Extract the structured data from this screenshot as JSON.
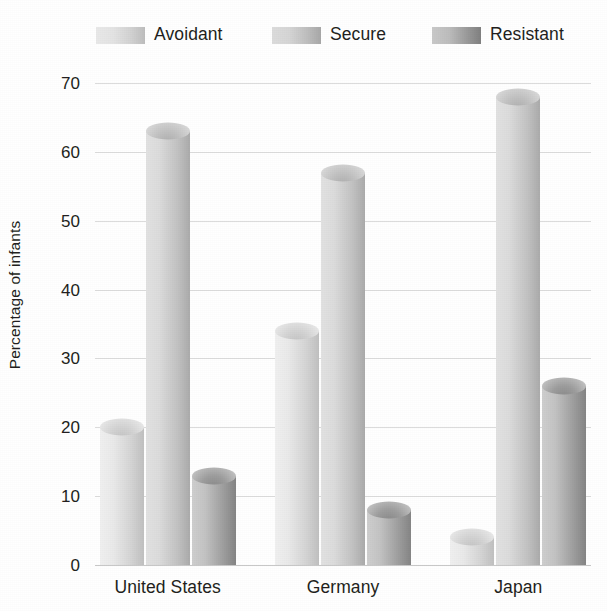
{
  "chart_data": {
    "type": "bar",
    "title": "",
    "subtitle": "",
    "xlabel": "",
    "ylabel": "Percentage of infants",
    "categories": [
      "United States",
      "Germany",
      "Japan"
    ],
    "series": [
      {
        "name": "Avoidant",
        "values": [
          20,
          34,
          4
        ],
        "color": "#d6d6d6"
      },
      {
        "name": "Secure",
        "values": [
          63,
          57,
          68
        ],
        "color": "#c2c2c2"
      },
      {
        "name": "Resistant",
        "values": [
          13,
          8,
          26
        ],
        "color": "#9a9a9a"
      }
    ],
    "ylim": [
      0,
      70
    ],
    "yticks": [
      0,
      10,
      20,
      30,
      40,
      50,
      60,
      70
    ],
    "ytick_labels": [
      "0",
      "10",
      "20",
      "30",
      "40",
      "50",
      "60",
      "70"
    ],
    "grid": true,
    "legend_position": "top",
    "style": "3d-cylinder-grayscale"
  },
  "legend": {
    "items": [
      {
        "label": "Avoidant",
        "swatch_name": "legend-swatch-avoidant",
        "light": "#e9e9e9",
        "dark": "#bdbdbd"
      },
      {
        "label": "Secure",
        "swatch_name": "legend-swatch-secure",
        "light": "#dcdcdc",
        "dark": "#a8a8a8"
      },
      {
        "label": "Resistant",
        "swatch_name": "legend-swatch-resistant",
        "light": "#c9c9c9",
        "dark": "#808080"
      }
    ]
  },
  "axes": {
    "y_title": "Percentage of infants",
    "y_tick_labels": [
      "70",
      "60",
      "50",
      "40",
      "30",
      "20",
      "10",
      "0"
    ],
    "x_tick_labels": [
      "United States",
      "Germany",
      "Japan"
    ]
  },
  "colors": {
    "gridline": "#dcdcdc",
    "baseline": "#c8c8c8",
    "text": "#231f20",
    "background": "#ffffff"
  }
}
